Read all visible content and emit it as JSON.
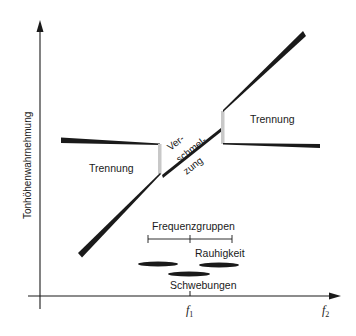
{
  "diagram": {
    "y_axis_label": "Tonhöhenwahrnehmung",
    "x_axis_ticks": [
      {
        "name": "f",
        "sub": "1"
      },
      {
        "name": "f",
        "sub": "2"
      }
    ],
    "regions": {
      "left_separation": "Trennung",
      "right_separation": "Trennung",
      "fusion_line1": "Ver-",
      "fusion_line2": "schmel-",
      "fusion_line3": "zung"
    },
    "bands": {
      "critical_bands": "Frequenzgruppen",
      "roughness": "Rauhigkeit",
      "beats": "Schwebungen"
    },
    "colors": {
      "ink": "#1a1a1a",
      "transition": "#c8c8c8",
      "background": "#ffffff"
    }
  }
}
